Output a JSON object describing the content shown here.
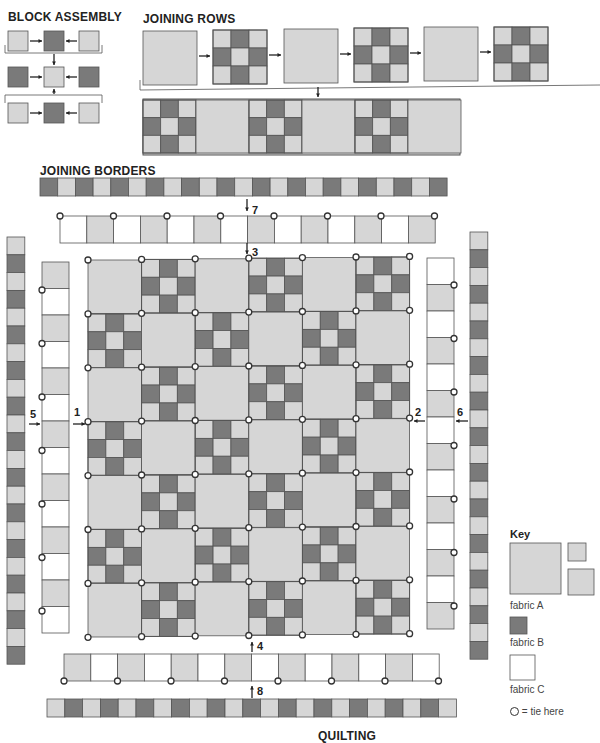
{
  "headings": {
    "block_assembly": "BLOCK ASSEMBLY",
    "joining_rows": "JOINING ROWS",
    "joining_borders": "JOINING BORDERS",
    "quilting": "QUILTING"
  },
  "step_numbers": [
    "1",
    "2",
    "3",
    "4",
    "5",
    "6",
    "7",
    "8"
  ],
  "key": {
    "title": "Key",
    "fabric_a": "fabric A",
    "fabric_b": "fabric B",
    "fabric_c": "fabric C",
    "tie_legend": "= tie here"
  },
  "colors": {
    "fabric_a": "#d6d6d6",
    "fabric_b": "#7a7a7a",
    "fabric_c": "#ffffff",
    "outline": "#555555"
  },
  "quilt": {
    "rows": 7,
    "cols": 6,
    "pattern": "alternating plain fabric-A blocks and nine-patch blocks (fabric A / fabric B)"
  }
}
